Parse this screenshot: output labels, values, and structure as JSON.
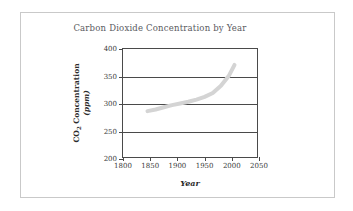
{
  "chart_data": {
    "type": "line",
    "title": "Carbon Dioxide Concentration by Year",
    "xlabel": "Year",
    "ylabel_line1": "CO2 Concentration",
    "ylabel_line2": "(ppm)",
    "ylabel_main": "CO",
    "ylabel_sub": "2",
    "ylabel_rest": " Concentration",
    "xlim": [
      1800,
      2050
    ],
    "ylim": [
      200,
      400
    ],
    "xticks": [
      1800,
      1850,
      1900,
      1950,
      2000,
      2050
    ],
    "yticks": [
      200,
      250,
      300,
      350,
      400
    ],
    "grid": "horizontal",
    "legend": "none",
    "series": [
      {
        "name": "CO2 concentration",
        "color": "#d4d4d4",
        "line_width": 4,
        "x": [
          1845,
          1860,
          1875,
          1890,
          1905,
          1920,
          1935,
          1950,
          1965,
          1980,
          1995,
          2005
        ],
        "y": [
          287,
          290,
          294,
          298,
          301,
          304,
          308,
          313,
          320,
          333,
          352,
          371
        ]
      }
    ]
  },
  "colors": {
    "axis": "#4a4a4a",
    "title_text": "#59595e",
    "label_text": "#2b2b2b",
    "tick_text": "#3a3a3a",
    "curve": "#d4d4d4",
    "frame": "#c9c9c9",
    "background": "#ffffff"
  }
}
